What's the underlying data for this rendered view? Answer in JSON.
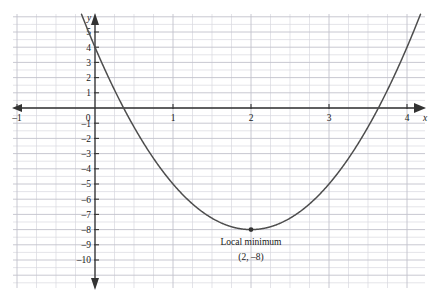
{
  "chart_data": {
    "type": "line",
    "title": "",
    "xlabel": "x",
    "ylabel": "y",
    "function_label": "y = 3(x - 2)^2 - 8",
    "xlim": [
      -1.6,
      4.35
    ],
    "ylim": [
      -11.8,
      6.2
    ],
    "grid": true,
    "grid_step_x": 0.25,
    "grid_step_y": 0.5,
    "legend": "none",
    "x_ticks": [
      {
        "value": -1,
        "label": "–1"
      },
      {
        "value": 0,
        "label": "0"
      },
      {
        "value": 1,
        "label": "1"
      },
      {
        "value": 2,
        "label": "2"
      },
      {
        "value": 3,
        "label": "3"
      },
      {
        "value": 4,
        "label": "4"
      }
    ],
    "y_ticks": [
      {
        "value": 5,
        "label": "5"
      },
      {
        "value": 4,
        "label": "4"
      },
      {
        "value": 3,
        "label": "3"
      },
      {
        "value": 2,
        "label": "2"
      },
      {
        "value": 1,
        "label": "1"
      },
      {
        "value": -1,
        "label": "–1"
      },
      {
        "value": -2,
        "label": "–2"
      },
      {
        "value": -3,
        "label": "–3"
      },
      {
        "value": -4,
        "label": "–4"
      },
      {
        "value": -5,
        "label": "–5"
      },
      {
        "value": -6,
        "label": "–6"
      },
      {
        "value": -7,
        "label": "–7"
      },
      {
        "value": -8,
        "label": "–8"
      },
      {
        "value": -9,
        "label": "–9"
      },
      {
        "value": -10,
        "label": "–10"
      }
    ],
    "points": [
      {
        "x": 2,
        "y": -8,
        "marker": "dot",
        "label_line1": "Local minimum",
        "label_line2": "(2, –8)"
      }
    ],
    "roots": [
      0.367,
      3.633
    ],
    "y_intercept": 4,
    "colors": {
      "curve": "#4d4d4d",
      "axis": "#333333",
      "grid_minor": "#d8d8e0",
      "grid_major": "#c2c2cc",
      "text": "#1a1a1a",
      "background": "#ffffff"
    }
  },
  "annotations": {
    "minimum_title": "Local minimum",
    "minimum_coords": "(2, –8)"
  },
  "axis_labels": {
    "x": "x",
    "y": "y"
  }
}
